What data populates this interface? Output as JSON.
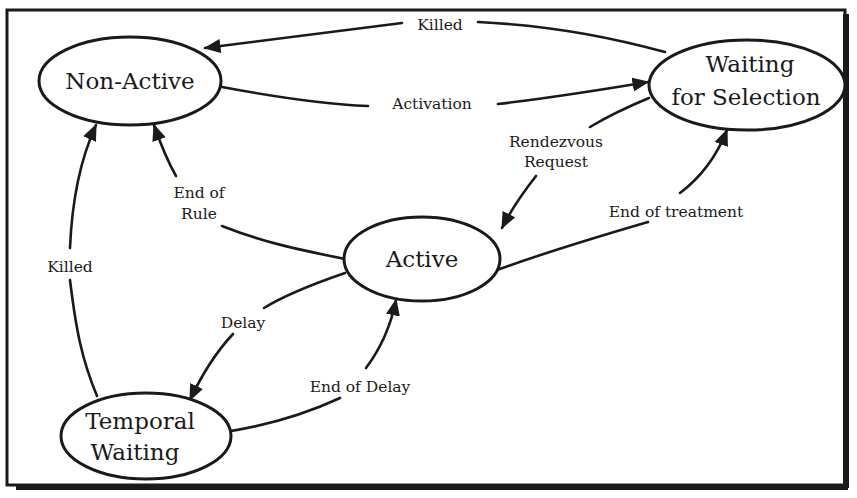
{
  "diagram": {
    "type": "state-transition",
    "colors": {
      "ink": "#1a1a1a",
      "background": "#ffffff"
    },
    "nodes": [
      {
        "id": "non_active",
        "label_lines": [
          "Non-Active"
        ]
      },
      {
        "id": "waiting_for_selection",
        "label_lines": [
          "Waiting",
          "for Selection"
        ]
      },
      {
        "id": "active",
        "label_lines": [
          "Active"
        ]
      },
      {
        "id": "temporal_waiting",
        "label_lines": [
          "Temporal",
          "Waiting"
        ]
      }
    ],
    "edges": [
      {
        "id": "killed_top",
        "from": "waiting_for_selection",
        "to": "non_active",
        "label_lines": [
          "Killed"
        ]
      },
      {
        "id": "activation",
        "from": "non_active",
        "to": "waiting_for_selection",
        "label_lines": [
          "Activation"
        ]
      },
      {
        "id": "rendezvous_request",
        "from": "waiting_for_selection",
        "to": "active",
        "label_lines": [
          "Rendezvous",
          "Request"
        ]
      },
      {
        "id": "end_of_treatment",
        "from": "active",
        "to": "waiting_for_selection",
        "label_lines": [
          "End of treatment"
        ]
      },
      {
        "id": "end_of_rule",
        "from": "active",
        "to": "non_active",
        "label_lines": [
          "End of",
          "Rule"
        ]
      },
      {
        "id": "killed_left",
        "from": "temporal_waiting",
        "to": "non_active",
        "label_lines": [
          "Killed"
        ]
      },
      {
        "id": "delay",
        "from": "active",
        "to": "temporal_waiting",
        "label_lines": [
          "Delay"
        ]
      },
      {
        "id": "end_of_delay",
        "from": "temporal_waiting",
        "to": "active",
        "label_lines": [
          "End of Delay"
        ]
      }
    ]
  }
}
